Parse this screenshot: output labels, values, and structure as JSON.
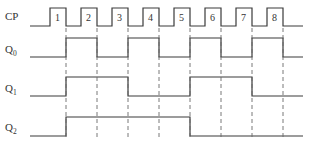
{
  "diagram": {
    "type": "timing-diagram",
    "signals": [
      {
        "name": "CP",
        "label": "CP",
        "subscript": ""
      },
      {
        "name": "Q0",
        "label": "Q",
        "subscript": "0"
      },
      {
        "name": "Q1",
        "label": "Q",
        "subscript": "1"
      },
      {
        "name": "Q2",
        "label": "Q",
        "subscript": "2"
      }
    ],
    "clock_pulses": [
      "1",
      "2",
      "3",
      "4",
      "5",
      "6",
      "7",
      "8"
    ],
    "waveforms": {
      "CP": [
        0,
        1,
        0,
        1,
        0,
        1,
        0,
        1,
        0,
        1,
        0,
        1,
        0,
        1,
        0,
        1,
        0
      ],
      "Q0": [
        0,
        1,
        0,
        1,
        0,
        1,
        0,
        1,
        0
      ],
      "Q1": [
        0,
        1,
        1,
        0,
        0,
        1,
        1,
        0,
        0
      ],
      "Q2": [
        0,
        1,
        1,
        1,
        1,
        0,
        0,
        0,
        0
      ]
    },
    "note": "Q values listed per interval between CP falling edges (before pulse 1, after pulse 1..8)"
  }
}
